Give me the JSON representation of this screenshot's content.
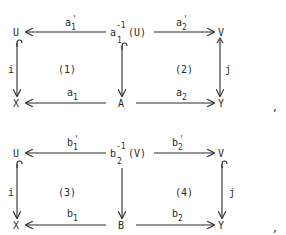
{
  "diagrams": [
    {
      "nodes": {
        "top_left": "U",
        "top_middle_base": "a",
        "top_middle_sup": "-1",
        "top_middle_sub": "1",
        "top_middle_arg": "(U)",
        "top_right": "V",
        "bottom_left": "X",
        "bottom_middle": "A",
        "bottom_right": "Y"
      },
      "arrows": {
        "top_left_base": "a",
        "top_left_sup": "'",
        "top_left_sub": "1",
        "top_right_base": "a",
        "top_right_sup": "'",
        "top_right_sub": "2",
        "bottom_left_base": "a",
        "bottom_left_sub": "1",
        "bottom_right_base": "a",
        "bottom_right_sub": "2",
        "left_vertical": "i",
        "right_vertical": "j"
      },
      "cells": {
        "left": "(1)",
        "right": "(2)"
      },
      "trailing_punct": ","
    },
    {
      "nodes": {
        "top_left": "U",
        "top_middle_base": "b",
        "top_middle_sup": "-1",
        "top_middle_sub": "2",
        "top_middle_arg": "(V)",
        "top_right": "V",
        "bottom_left": "X",
        "bottom_middle": "B",
        "bottom_right": "Y"
      },
      "arrows": {
        "top_left_base": "b",
        "top_left_sup": "'",
        "top_left_sub": "1",
        "top_right_base": "b",
        "top_right_sup": "'",
        "top_right_sub": "2",
        "bottom_left_base": "b",
        "bottom_left_sub": "1",
        "bottom_right_base": "b",
        "bottom_right_sub": "2",
        "left_vertical": "i",
        "right_vertical": "j"
      },
      "cells": {
        "left": "(3)",
        "right": "(4)"
      },
      "trailing_punct": ","
    }
  ]
}
